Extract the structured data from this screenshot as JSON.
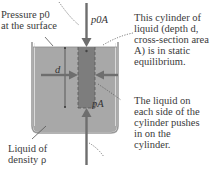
{
  "labels": {
    "surface_pressure": [
      "Pressure p0",
      "at the surface"
    ],
    "cylinder_note": [
      "This cylinder of",
      "liquid (depth d,",
      "cross-section area",
      "A) is in static",
      "equilibrium."
    ],
    "side_note": [
      "The liquid on",
      "each side of the",
      "cylinder pushes",
      "in on the",
      "cylinder."
    ],
    "liquid_note": [
      "Liquid of",
      "density ρ"
    ]
  },
  "forces": {
    "top": "p0A",
    "bottom": "pA"
  },
  "dimension": {
    "depth": "d"
  },
  "colors": {
    "liquid": "#a8a8a8",
    "cylinder": "#7d7d7d",
    "arrow": "#6e6e6e",
    "container_edge": "#8a8a8a",
    "text": "#3a3a3a"
  }
}
